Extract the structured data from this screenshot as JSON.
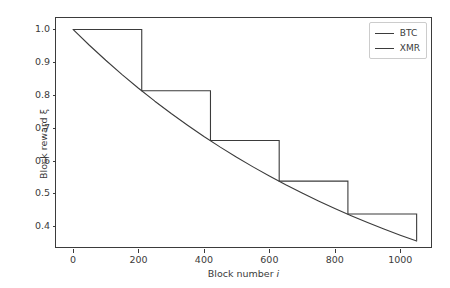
{
  "chart_data": {
    "type": "line",
    "title": "",
    "xlabel": "Block number i",
    "ylabel": "Block reward ξ",
    "xlim": [
      -52,
      1100
    ],
    "ylim": [
      0.33,
      1.035
    ],
    "xticks": [
      0,
      200,
      400,
      600,
      800,
      1000
    ],
    "xticklabels": [
      "0",
      "200",
      "400",
      "600",
      "800",
      "1000"
    ],
    "yticks": [
      0.4,
      0.5,
      0.6,
      0.7,
      0.8,
      0.9,
      1.0
    ],
    "yticklabels": [
      "0.4",
      "0.5",
      "0.6",
      "0.7",
      "0.8",
      "0.9",
      "1.0"
    ],
    "grid": false,
    "legend_position": "upper right",
    "series": [
      {
        "name": "BTC",
        "style": "step-post",
        "color": "#3b3b3b",
        "step_edges": [
          0,
          210,
          420,
          630,
          840,
          1050
        ],
        "step_values": [
          1.0,
          0.813,
          0.661,
          0.537,
          0.437,
          0.355
        ],
        "x": [
          0,
          210,
          210,
          420,
          420,
          630,
          630,
          840,
          840,
          1050,
          1050
        ],
        "y": [
          1.0,
          1.0,
          0.813,
          0.813,
          0.661,
          0.661,
          0.537,
          0.537,
          0.437,
          0.437,
          0.355
        ]
      },
      {
        "name": "XMR",
        "style": "smooth-decay",
        "color": "#3b3b3b",
        "x": [
          0,
          50,
          100,
          150,
          200,
          250,
          300,
          350,
          400,
          450,
          500,
          550,
          600,
          650,
          700,
          750,
          800,
          850,
          900,
          950,
          1000,
          1050
        ],
        "y": [
          1.0,
          0.9519,
          0.906,
          0.8623,
          0.8207,
          0.7811,
          0.7434,
          0.7076,
          0.6734,
          0.6409,
          0.61,
          0.5806,
          0.5526,
          0.5259,
          0.5006,
          0.4764,
          0.4534,
          0.4315,
          0.4107,
          0.3909,
          0.372,
          0.3541
        ]
      }
    ]
  },
  "legend": {
    "entries": [
      {
        "label": "BTC",
        "color": "#3b3b3b"
      },
      {
        "label": "XMR",
        "color": "#3b3b3b"
      }
    ]
  },
  "colors": {
    "axis": "#3b3b3b",
    "background": "#ffffff",
    "legend_border": "#cccccc"
  }
}
